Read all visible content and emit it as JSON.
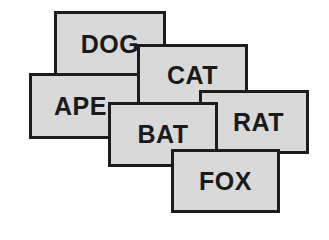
{
  "cards": [
    {
      "label": "DOG"
    },
    {
      "label": "APE"
    },
    {
      "label": "CAT"
    },
    {
      "label": "RAT"
    },
    {
      "label": "BAT"
    },
    {
      "label": "FOX"
    }
  ],
  "colors": {
    "card_fill": "#d9d9d9",
    "card_border": "#1c1c1c",
    "text": "#1a1a1a",
    "background": "#ffffff"
  }
}
